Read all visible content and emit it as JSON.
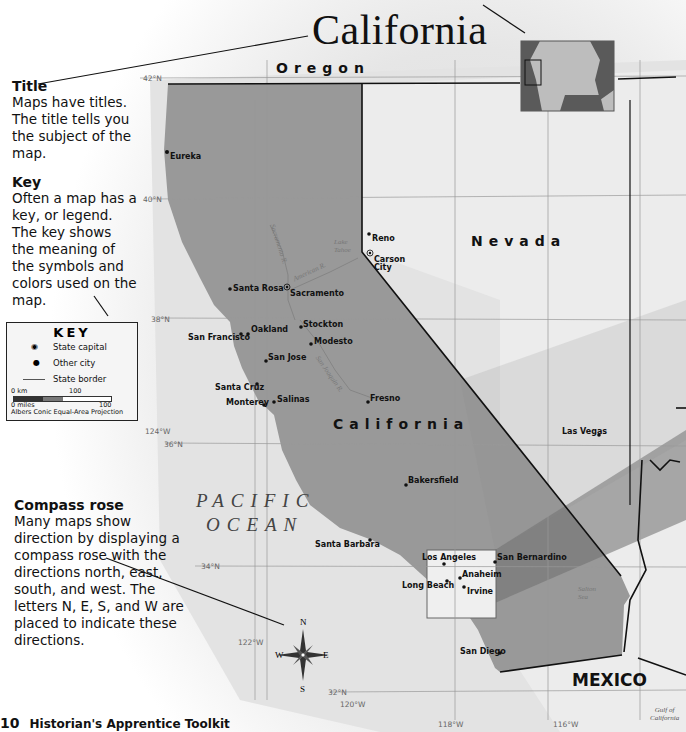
{
  "title": "California",
  "callouts": {
    "title": {
      "heading": "Title",
      "body": "Maps have titles. The title tells you the subject of the map."
    },
    "key": {
      "heading": "Key",
      "body": "Often a map has a key, or legend. The key shows the meaning of the symbols and colors used on the map."
    },
    "compass": {
      "heading": "Compass rose",
      "body": "Many maps show direction by displaying a compass rose with the directions north, east, south, and west. The letters N, E, S, and W are placed to indicate these directions."
    }
  },
  "key": {
    "title": "KEY",
    "items": [
      {
        "symbol": "state-capital-icon",
        "label": "State capital"
      },
      {
        "symbol": "city-dot-icon",
        "label": "Other city"
      },
      {
        "symbol": "state-border-line",
        "label": "State border"
      }
    ],
    "scale": {
      "km_start": "0 km",
      "km_end": "100",
      "mi_start": "0 miles",
      "mi_end": "100"
    },
    "projection": "Albers Conic Equal-Area Projection"
  },
  "regions": {
    "oregon": "Oregon",
    "nevada": "Nevada",
    "california": "California",
    "mexico": "MEXICO",
    "ocean_line1": "PACIFIC",
    "ocean_line2": "OCEAN",
    "gulf_line1": "Gulf of",
    "gulf_line2": "California",
    "lake_tahoe": "Lake Tahoe",
    "salton_sea": "Salton Sea",
    "sacramento_river": "Sacramento R.",
    "american_river": "American R.",
    "san_joaquin_river": "San Joaquin R."
  },
  "cities": {
    "eureka": "Eureka",
    "reno": "Reno",
    "carson_city_1": "Carson",
    "carson_city_2": "City",
    "santa_rosa": "Santa Rosa",
    "sacramento": "Sacramento",
    "oakland": "Oakland",
    "san_francisco": "San Francisco",
    "stockton": "Stockton",
    "modesto": "Modesto",
    "san_jose": "San Jose",
    "santa_cruz": "Santa Cruz",
    "monterey": "Monterey",
    "salinas": "Salinas",
    "fresno": "Fresno",
    "bakersfield": "Bakersfield",
    "las_vegas": "Las Vegas",
    "santa_barbara": "Santa Barbara",
    "los_angeles": "Los Angeles",
    "san_bernardino": "San Bernardino",
    "long_beach": "Long Beach",
    "anaheim": "Anaheim",
    "irvine": "Irvine",
    "san_diego": "San Diego"
  },
  "grid": {
    "lat_42": "42°N",
    "lat_40": "40°N",
    "lat_38": "38°N",
    "lat_36": "36°N",
    "lat_34": "34°N",
    "lat_32": "32°N",
    "lon_124": "124°W",
    "lon_122": "122°W",
    "lon_120": "120°W",
    "lon_118": "118°W",
    "lon_116": "116°W"
  },
  "compass": {
    "n": "N",
    "e": "E",
    "s": "S",
    "w": "W"
  },
  "footer": {
    "page_number": "10",
    "book_title": "Historian's Apprentice Toolkit"
  }
}
